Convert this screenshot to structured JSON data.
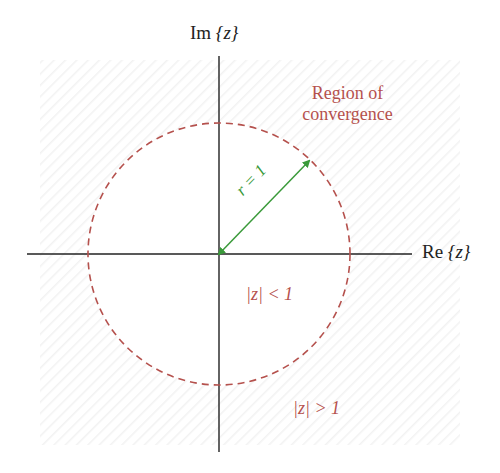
{
  "diagram": {
    "axes": {
      "imaginary_label_prefix": "Im",
      "imaginary_label_arg": "{z}",
      "real_label_prefix": "Re",
      "real_label_arg": "{z}"
    },
    "region_label_line1": "Region of",
    "region_label_line2": "convergence",
    "radius_label": "r = 1",
    "inside_label": "|z| < 1",
    "outside_label": "|z| > 1",
    "circle": {
      "center": [
        219,
        254
      ],
      "radius": 131,
      "stroke": "#b5514d",
      "dashed": true
    },
    "arrow": {
      "from": [
        219,
        254
      ],
      "to": [
        309,
        161
      ],
      "color": "#3a9a3a"
    },
    "colors": {
      "axis": "#222222",
      "roc": "#b5514d",
      "radius": "#3a9a3a",
      "hatch": "#f4f4f4"
    }
  }
}
